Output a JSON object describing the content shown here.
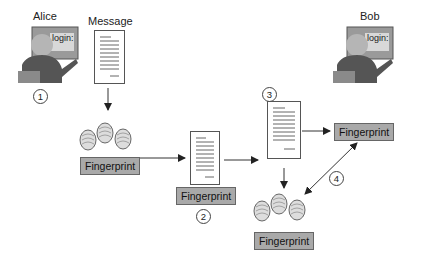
{
  "diagram": {
    "type": "digital-signature-verification-flow",
    "actors": {
      "alice": {
        "label": "Alice",
        "screen_text": "login:"
      },
      "bob": {
        "label": "Bob",
        "screen_text": "login:"
      }
    },
    "message_label": "Message",
    "fingerprint_label": "Fingerprint",
    "steps": [
      "1",
      "2",
      "3",
      "4"
    ],
    "colors": {
      "label_fill": "#a9a9a9",
      "line": "#333333",
      "background": "#ffffff"
    }
  }
}
